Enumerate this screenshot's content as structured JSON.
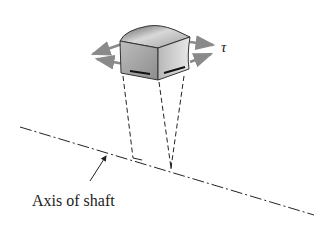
{
  "diagram": {
    "symbol": "τ",
    "axis_label": "Axis of shaft",
    "colors": {
      "line": "#222222",
      "arrow": "#8a8a8a",
      "block_light": "#e4e4e4",
      "block_dark": "#6e6e6e"
    }
  }
}
